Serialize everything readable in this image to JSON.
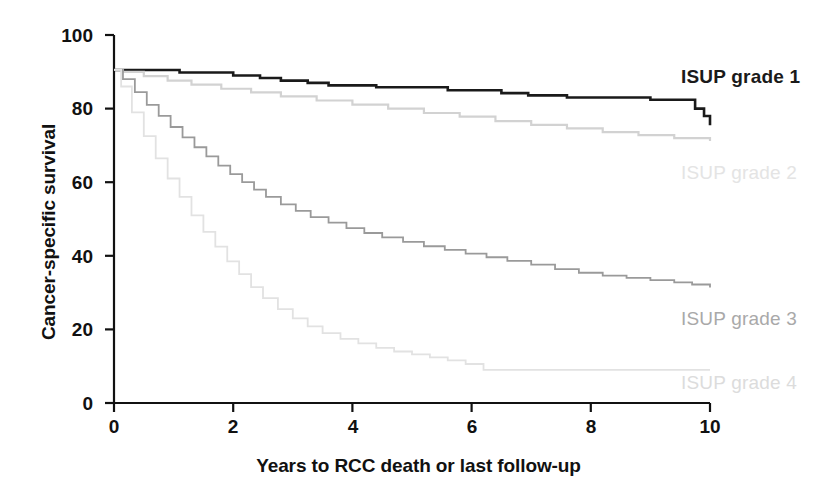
{
  "chart_data": {
    "type": "line",
    "subtype": "kaplan-meier-step",
    "title": "",
    "xlabel": "Years to RCC death or last follow-up",
    "ylabel": "Cancer-specific survival",
    "xlim": [
      0,
      10
    ],
    "ylim": [
      0,
      100
    ],
    "xticks": [
      "0",
      "2",
      "4",
      "6",
      "8",
      "10"
    ],
    "yticks": [
      "0",
      "20",
      "40",
      "60",
      "80",
      "100"
    ],
    "xtick_values": [
      0,
      2,
      4,
      6,
      8,
      10
    ],
    "ytick_values": [
      0,
      20,
      40,
      60,
      80,
      100
    ],
    "grid": false,
    "legend_position": "inline-right",
    "series": [
      {
        "name": "ISUP grade 1",
        "color": "#1a1a1a",
        "line_width": 2.6,
        "label_x": 9.5,
        "label_y": 85.5,
        "x": [
          0,
          0.2,
          1.05,
          1.1,
          1.9,
          2.0,
          2.35,
          2.45,
          2.6,
          2.8,
          3.0,
          3.25,
          3.45,
          3.6,
          4.0,
          4.4,
          5.2,
          5.6,
          6.4,
          6.5,
          6.8,
          6.95,
          7.1,
          7.6,
          8.2,
          9.0,
          9.5,
          9.75,
          9.9,
          10.0
        ],
        "y": [
          90.5,
          90.5,
          90.5,
          89.8,
          89.8,
          89.0,
          89.0,
          88.3,
          88.3,
          87.6,
          87.6,
          87.0,
          87.0,
          86.3,
          86.3,
          85.8,
          85.8,
          85.0,
          85.0,
          84.2,
          84.2,
          83.6,
          83.6,
          83.0,
          83.0,
          82.4,
          82.4,
          80.0,
          78.0,
          75.5
        ]
      },
      {
        "name": "ISUP grade 2",
        "color": "#d2d2d2",
        "line_width": 2.2,
        "label_x": 9.5,
        "label_y": 46.0,
        "x": [
          0,
          0.15,
          0.5,
          0.9,
          1.3,
          1.8,
          2.3,
          2.8,
          3.4,
          4.0,
          4.6,
          5.2,
          5.8,
          6.4,
          7.0,
          7.6,
          8.2,
          8.8,
          9.4,
          10.0
        ],
        "y": [
          90.5,
          90.0,
          88.8,
          87.6,
          86.5,
          85.4,
          84.4,
          83.3,
          82.2,
          81.1,
          80.0,
          78.8,
          77.8,
          76.6,
          75.6,
          74.6,
          73.6,
          72.8,
          72.0,
          71.2
        ]
      },
      {
        "name": "ISUP grade 3",
        "color": "#9a9a9a",
        "line_width": 1.8,
        "label_x": 9.5,
        "label_y": 21.5,
        "x": [
          0,
          0.15,
          0.35,
          0.55,
          0.75,
          0.95,
          1.15,
          1.35,
          1.55,
          1.75,
          1.95,
          2.15,
          2.35,
          2.55,
          2.8,
          3.05,
          3.3,
          3.6,
          3.9,
          4.2,
          4.5,
          4.85,
          5.2,
          5.55,
          5.9,
          6.25,
          6.6,
          7.0,
          7.4,
          7.8,
          8.2,
          8.6,
          9.0,
          9.4,
          9.7,
          10.0
        ],
        "y": [
          90.5,
          88.0,
          84.5,
          81.0,
          78.0,
          75.0,
          72.2,
          69.5,
          67.0,
          64.5,
          62.2,
          60.0,
          58.0,
          56.0,
          54.0,
          52.2,
          50.5,
          49.0,
          47.5,
          46.2,
          45.0,
          43.8,
          42.6,
          41.6,
          40.6,
          39.6,
          38.6,
          37.6,
          36.4,
          35.4,
          34.6,
          34.0,
          33.4,
          32.8,
          32.2,
          31.4
        ]
      },
      {
        "name": "ISUP grade 4",
        "color": "#e2e2e2",
        "line_width": 1.8,
        "label_x": 9.5,
        "label_y": 4.5,
        "x": [
          0,
          0.12,
          0.3,
          0.5,
          0.7,
          0.9,
          1.1,
          1.3,
          1.5,
          1.7,
          1.9,
          2.1,
          2.3,
          2.5,
          2.75,
          3.0,
          3.25,
          3.5,
          3.8,
          4.1,
          4.4,
          4.7,
          5.0,
          5.3,
          5.6,
          5.9,
          6.2,
          7.0,
          8.0,
          9.0,
          10.0
        ],
        "y": [
          90.5,
          86.0,
          79.0,
          72.5,
          66.5,
          61.0,
          56.0,
          51.0,
          46.5,
          42.5,
          38.5,
          35.0,
          31.5,
          28.5,
          25.5,
          23.0,
          20.8,
          19.0,
          17.4,
          16.2,
          15.0,
          14.0,
          13.2,
          12.4,
          11.6,
          10.6,
          9.0,
          9.0,
          9.0,
          9.0,
          9.0
        ]
      }
    ]
  },
  "axes": {
    "y_title": "Cancer-specific survival",
    "x_title": "Years to RCC death or last follow-up",
    "ytick_labels": [
      "100",
      "80",
      "60",
      "40",
      "20",
      "0"
    ],
    "xtick_labels": [
      "0",
      "2",
      "4",
      "6",
      "8",
      "10"
    ]
  },
  "legend": {
    "items": [
      {
        "label": "ISUP grade 1",
        "color": "#1a1a1a"
      },
      {
        "label": "ISUP grade 2",
        "color": "#d2d2d2"
      },
      {
        "label": "ISUP grade 3",
        "color": "#9a9a9a"
      },
      {
        "label": "ISUP grade 4",
        "color": "#d8d8d8"
      }
    ]
  },
  "colors": {
    "axis": "#111111",
    "background": "#ffffff",
    "grade1": "#1a1a1a",
    "grade2": "#d2d2d2",
    "grade3": "#9a9a9a",
    "grade4": "#e2e2e2"
  }
}
